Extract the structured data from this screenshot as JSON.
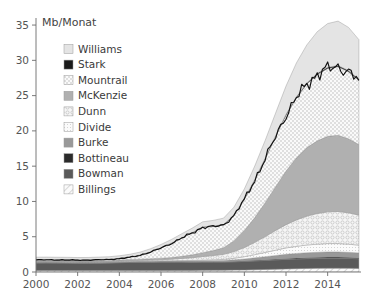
{
  "chart_data": {
    "type": "area",
    "title": "",
    "subtitle": "",
    "ylabel": "Mb/Monat",
    "xlabel": "",
    "grid": false,
    "legend_position": "upper-left-inside",
    "xlim": [
      2000,
      2015.6
    ],
    "ylim": [
      0,
      36
    ],
    "yticks": [
      0,
      5,
      10,
      15,
      20,
      25,
      30,
      35
    ],
    "ytick_labels": [
      "0",
      "5",
      "10",
      "15",
      "20",
      "25",
      "30",
      "35"
    ],
    "xticks": [
      2000,
      2002,
      2004,
      2006,
      2008,
      2010,
      2012,
      2014
    ],
    "xtick_labels": [
      "2000",
      "2002",
      "2004",
      "2006",
      "2008",
      "2010",
      "2012",
      "2014"
    ],
    "stacking": "stacked-area",
    "stack_order_bottom_to_top": [
      "Billings",
      "Bowman",
      "Bottineau",
      "Burke",
      "Divide",
      "Dunn",
      "McKenzie",
      "Mountrail",
      "Stark",
      "Williams"
    ],
    "total_line": {
      "name": "Total",
      "color": "#111111",
      "note": "black outline tracing top of Mountrail stack level"
    },
    "x": [
      2000.0,
      2000.5,
      2001.0,
      2001.5,
      2002.0,
      2002.5,
      2003.0,
      2003.5,
      2004.0,
      2004.5,
      2005.0,
      2005.5,
      2006.0,
      2006.5,
      2007.0,
      2007.5,
      2008.0,
      2008.5,
      2009.0,
      2009.5,
      2010.0,
      2010.5,
      2011.0,
      2011.5,
      2012.0,
      2012.5,
      2013.0,
      2013.5,
      2014.0,
      2014.5,
      2015.0,
      2015.5
    ],
    "series": [
      {
        "name": "Williams",
        "color": "#e4e4e4",
        "pattern": "solid",
        "values": [
          0.35,
          0.35,
          0.34,
          0.34,
          0.33,
          0.33,
          0.34,
          0.35,
          0.36,
          0.38,
          0.4,
          0.42,
          0.45,
          0.5,
          0.55,
          0.62,
          0.7,
          0.8,
          0.9,
          1.1,
          1.4,
          1.9,
          2.5,
          3.2,
          4.0,
          4.8,
          5.4,
          5.9,
          6.2,
          6.3,
          6.1,
          5.6
        ]
      },
      {
        "name": "Stark",
        "color": "#1a1a1a",
        "pattern": "solid",
        "values": [
          0.04,
          0.04,
          0.04,
          0.04,
          0.04,
          0.04,
          0.04,
          0.04,
          0.05,
          0.05,
          0.05,
          0.05,
          0.05,
          0.06,
          0.06,
          0.07,
          0.07,
          0.08,
          0.08,
          0.09,
          0.1,
          0.11,
          0.12,
          0.13,
          0.14,
          0.15,
          0.16,
          0.17,
          0.18,
          0.18,
          0.18,
          0.17
        ]
      },
      {
        "name": "Mountrail",
        "color": "#f2f2f2",
        "pattern": "dots",
        "values": [
          0.1,
          0.1,
          0.1,
          0.1,
          0.1,
          0.11,
          0.12,
          0.14,
          0.18,
          0.3,
          0.55,
          0.95,
          1.45,
          2.0,
          2.6,
          3.1,
          3.6,
          3.4,
          3.2,
          3.6,
          4.4,
          5.3,
          6.2,
          7.1,
          7.9,
          8.5,
          9.0,
          9.4,
          9.6,
          9.7,
          9.5,
          9.1
        ]
      },
      {
        "name": "McKenzie",
        "color": "#b0b0b0",
        "pattern": "solid",
        "values": [
          0.12,
          0.12,
          0.12,
          0.12,
          0.12,
          0.12,
          0.13,
          0.13,
          0.14,
          0.15,
          0.16,
          0.18,
          0.2,
          0.24,
          0.3,
          0.4,
          0.55,
          0.7,
          0.95,
          1.5,
          2.4,
          3.5,
          4.8,
          6.2,
          7.6,
          8.8,
          9.7,
          10.3,
          10.7,
          10.8,
          10.5,
          10.0
        ]
      },
      {
        "name": "Dunn",
        "color": "#ededed",
        "pattern": "circles",
        "values": [
          0.06,
          0.06,
          0.06,
          0.06,
          0.06,
          0.06,
          0.07,
          0.07,
          0.08,
          0.09,
          0.1,
          0.12,
          0.15,
          0.2,
          0.28,
          0.38,
          0.5,
          0.6,
          0.72,
          0.95,
          1.3,
          1.75,
          2.25,
          2.8,
          3.3,
          3.75,
          4.1,
          4.35,
          4.5,
          4.55,
          4.45,
          4.25
        ]
      },
      {
        "name": "Divide",
        "color": "#f5f5f5",
        "pattern": "fine-dots",
        "values": [
          0.03,
          0.03,
          0.03,
          0.03,
          0.03,
          0.03,
          0.03,
          0.03,
          0.04,
          0.04,
          0.04,
          0.05,
          0.05,
          0.06,
          0.07,
          0.08,
          0.1,
          0.12,
          0.15,
          0.22,
          0.32,
          0.45,
          0.6,
          0.75,
          0.9,
          1.0,
          1.1,
          1.15,
          1.18,
          1.18,
          1.15,
          1.1
        ]
      },
      {
        "name": "Burke",
        "color": "#999999",
        "pattern": "solid",
        "values": [
          0.08,
          0.08,
          0.08,
          0.08,
          0.08,
          0.08,
          0.08,
          0.08,
          0.08,
          0.09,
          0.09,
          0.09,
          0.1,
          0.1,
          0.11,
          0.12,
          0.13,
          0.14,
          0.16,
          0.2,
          0.26,
          0.34,
          0.42,
          0.5,
          0.58,
          0.64,
          0.68,
          0.71,
          0.73,
          0.73,
          0.71,
          0.68
        ]
      },
      {
        "name": "Bottineau",
        "color": "#2b2b2b",
        "pattern": "solid",
        "values": [
          0.05,
          0.05,
          0.05,
          0.05,
          0.05,
          0.05,
          0.05,
          0.05,
          0.05,
          0.05,
          0.05,
          0.05,
          0.05,
          0.05,
          0.06,
          0.06,
          0.06,
          0.07,
          0.07,
          0.08,
          0.09,
          0.1,
          0.11,
          0.12,
          0.13,
          0.14,
          0.15,
          0.15,
          0.16,
          0.16,
          0.15,
          0.15
        ]
      },
      {
        "name": "Bowman",
        "color": "#5a5a5a",
        "pattern": "solid",
        "values": [
          1.05,
          1.06,
          1.05,
          1.04,
          1.03,
          1.03,
          1.04,
          1.06,
          1.1,
          1.14,
          1.16,
          1.17,
          1.18,
          1.18,
          1.17,
          1.16,
          1.16,
          1.15,
          1.14,
          1.16,
          1.2,
          1.24,
          1.28,
          1.32,
          1.36,
          1.38,
          1.4,
          1.41,
          1.42,
          1.42,
          1.4,
          1.37
        ]
      },
      {
        "name": "Billings",
        "color": "#f0f0f0",
        "pattern": "diagonal-hatch",
        "values": [
          0.22,
          0.22,
          0.22,
          0.22,
          0.21,
          0.21,
          0.21,
          0.21,
          0.22,
          0.22,
          0.22,
          0.22,
          0.22,
          0.22,
          0.23,
          0.23,
          0.24,
          0.25,
          0.26,
          0.28,
          0.3,
          0.33,
          0.36,
          0.4,
          0.44,
          0.47,
          0.5,
          0.52,
          0.54,
          0.54,
          0.53,
          0.51
        ]
      }
    ]
  },
  "axes": {
    "y_axis_title": "Mb/Monat",
    "y_ticks": [
      "35",
      "30",
      "25",
      "20",
      "15",
      "10",
      "5",
      "0"
    ],
    "x_ticks": [
      "2000",
      "2002",
      "2004",
      "2006",
      "2008",
      "2010",
      "2012",
      "2014"
    ]
  },
  "legend": {
    "items": [
      {
        "label": "Williams",
        "swatch": "williams-swatch",
        "color": "#e4e4e4",
        "pattern": "solid"
      },
      {
        "label": "Stark",
        "swatch": "stark-swatch",
        "color": "#1a1a1a",
        "pattern": "solid"
      },
      {
        "label": "Mountrail",
        "swatch": "mountrail-swatch",
        "color": "#f2f2f2",
        "pattern": "dots"
      },
      {
        "label": "McKenzie",
        "swatch": "mckenzie-swatch",
        "color": "#b0b0b0",
        "pattern": "solid"
      },
      {
        "label": "Dunn",
        "swatch": "dunn-swatch",
        "color": "#ededed",
        "pattern": "circles"
      },
      {
        "label": "Divide",
        "swatch": "divide-swatch",
        "color": "#f5f5f5",
        "pattern": "fine-dots"
      },
      {
        "label": "Burke",
        "swatch": "burke-swatch",
        "color": "#999999",
        "pattern": "solid"
      },
      {
        "label": "Bottineau",
        "swatch": "bottineau-swatch",
        "color": "#2b2b2b",
        "pattern": "solid"
      },
      {
        "label": "Bowman",
        "swatch": "bowman-swatch",
        "color": "#5a5a5a",
        "pattern": "solid"
      },
      {
        "label": "Billings",
        "swatch": "billings-swatch",
        "color": "#f0f0f0",
        "pattern": "diagonal-hatch"
      }
    ]
  },
  "colors": {
    "axis": "#6b6b6b",
    "text": "#3a3a3a",
    "line": "#111111",
    "background": "#ffffff"
  }
}
